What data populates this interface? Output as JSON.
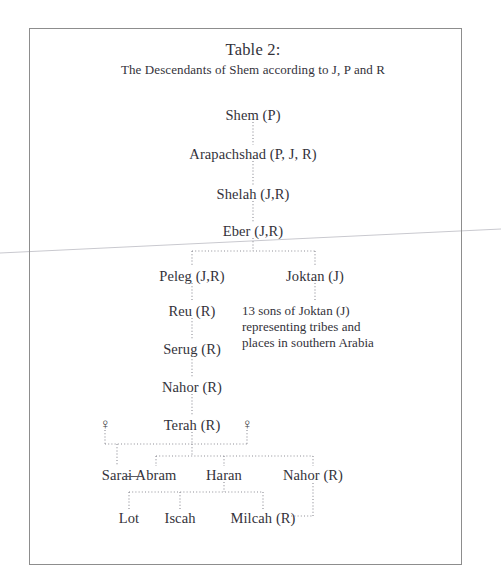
{
  "document": {
    "title_line1": "Table 2:",
    "title_line2": "The Descendants of Shem according to J, P and R"
  },
  "genealogy": {
    "shem": "Shem (P)",
    "arapachshad": "Arapachshad (P, J, R)",
    "shelah": "Shelah (J,R)",
    "eber": "Eber (J,R)",
    "peleg": "Peleg (J,R)",
    "joktan": "Joktan (J)",
    "reu": "Reu (R)",
    "serug": "Serug (R)",
    "nahor_upper": "Nahor (R)",
    "terah": "Terah (R)",
    "sarai": "Sarai",
    "abram": "Abram",
    "haran": "Haran",
    "nahor_lower": "Nahor (R)",
    "lot": "Lot",
    "iscah": "Iscah",
    "milcah": "Milcah (R)",
    "wife_symbol_left": "♀",
    "wife_symbol_right": "♀"
  },
  "annotation": {
    "joktan_note_line1": "13 sons of Joktan (J)",
    "joktan_note_line2": "representing tribes and",
    "joktan_note_line3": "places in southern Arabia"
  },
  "style": {
    "text_color": "#33323a",
    "line_color": "#8f8f97",
    "border_color": "#8d8d8d",
    "background": "#ffffff"
  }
}
